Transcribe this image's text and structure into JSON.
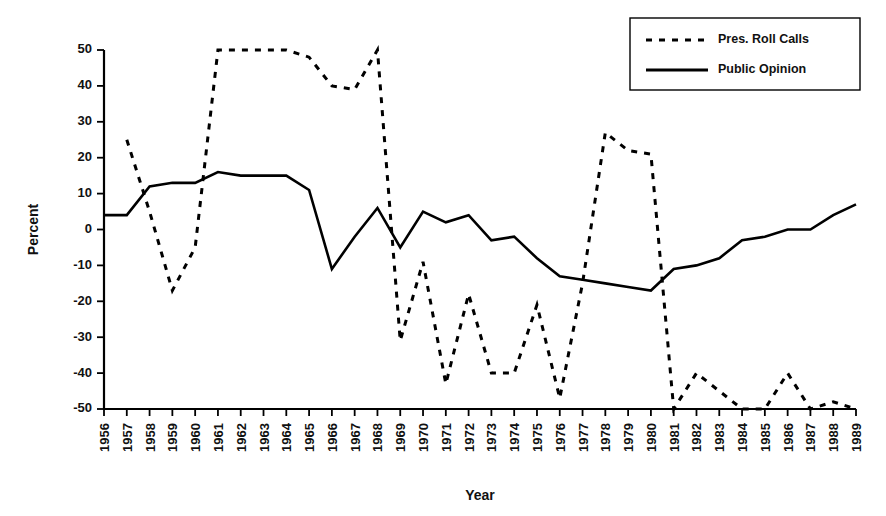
{
  "chart_data": {
    "type": "line",
    "title": "",
    "xlabel": "Year",
    "ylabel": "Percent",
    "ylim": [
      -50,
      50
    ],
    "ytick_values": [
      50,
      40,
      30,
      20,
      10,
      0,
      -10,
      -20,
      -30,
      -40,
      -50
    ],
    "ytick_labels": [
      "50",
      "40",
      "30",
      "20",
      "10",
      "0",
      "-10",
      "-20",
      "-30",
      "-40",
      "-50"
    ],
    "grid": false,
    "legend_position": "top-right",
    "x": [
      1956,
      1957,
      1958,
      1959,
      1960,
      1961,
      1962,
      1963,
      1964,
      1965,
      1966,
      1967,
      1968,
      1969,
      1970,
      1971,
      1972,
      1973,
      1974,
      1975,
      1976,
      1977,
      1978,
      1979,
      1980,
      1981,
      1982,
      1983,
      1984,
      1985,
      1986,
      1987,
      1988,
      1989
    ],
    "categories": [
      "1956",
      "1957",
      "1958",
      "1959",
      "1960",
      "1961",
      "1962",
      "1963",
      "1964",
      "1965",
      "1966",
      "1967",
      "1968",
      "1969",
      "1970",
      "1971",
      "1972",
      "1973",
      "1974",
      "1975",
      "1976",
      "1977",
      "1978",
      "1979",
      "1980",
      "1981",
      "1982",
      "1983",
      "1984",
      "1985",
      "1986",
      "1987",
      "1988",
      "1989"
    ],
    "series": [
      {
        "name": "Pres. Roll Calls",
        "style": "dashed",
        "color": "#000000",
        "values": [
          null,
          25,
          5,
          -17,
          -5,
          50,
          50,
          50,
          50,
          48,
          40,
          39,
          50,
          -31,
          -9,
          -43,
          -18,
          -40,
          -40,
          -21,
          -47,
          -15,
          27,
          22,
          21,
          -50,
          -40,
          -45,
          -50,
          -50,
          -40,
          -50,
          -48,
          -50
        ]
      },
      {
        "name": "Public Opinion",
        "style": "solid",
        "color": "#000000",
        "values": [
          4,
          4,
          12,
          13,
          13,
          16,
          15,
          15,
          15,
          11,
          -11,
          -2,
          6,
          -5,
          5,
          2,
          4,
          -3,
          -2,
          -8,
          -13,
          -14,
          -15,
          -16,
          -17,
          -11,
          -10,
          -8,
          -3,
          -2,
          0,
          0,
          4,
          7
        ]
      }
    ]
  },
  "legend": {
    "entries": [
      {
        "label": "Pres. Roll Calls",
        "style": "dashed"
      },
      {
        "label": "Public Opinion",
        "style": "solid"
      }
    ]
  },
  "axes": {
    "y_title": "Percent",
    "x_title": "Year"
  }
}
